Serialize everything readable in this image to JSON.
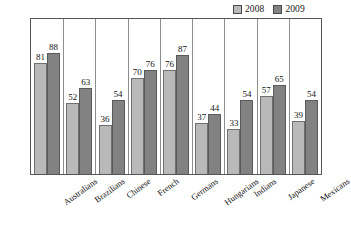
{
  "chart_data": {
    "type": "bar",
    "title": "",
    "subtitle": "",
    "xlabel": "",
    "ylabel": "",
    "ylim": [
      0,
      100
    ],
    "grid": false,
    "legend_position": "top-right",
    "categories": [
      "Australians",
      "Brazilians",
      "Chinese",
      "French",
      "Germans",
      "Hungarians",
      "Indians",
      "Japanese",
      "Mexicans"
    ],
    "series": [
      {
        "name": "2008",
        "color": "#b9b9b9",
        "values": [
          81,
          52,
          36,
          70,
          76,
          37,
          33,
          57,
          39
        ]
      },
      {
        "name": "2009",
        "color": "#828282",
        "values": [
          88,
          63,
          54,
          76,
          87,
          44,
          54,
          65,
          54
        ]
      }
    ]
  },
  "legend": {
    "entries": [
      {
        "label": "2008",
        "color": "#b9b9b9"
      },
      {
        "label": "2009",
        "color": "#828282"
      }
    ]
  }
}
